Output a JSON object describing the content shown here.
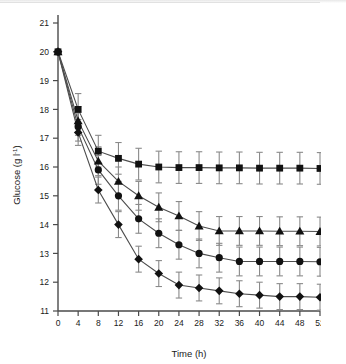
{
  "figure": {
    "background_color": "#ffffff",
    "axis_color": "#4a4a4a",
    "marker_color": "#111111",
    "line_color": "#4d4d4d",
    "errorbar_color": "#8a8a8a"
  },
  "chart_data": {
    "type": "line",
    "title": "",
    "subtitle": "",
    "xlabel": "Time (h)",
    "ylabel": "Glucose (g l⁻¹)",
    "ylabel_base": "Glucose (g l",
    "ylabel_exponent": "-1",
    "ylabel_close": ")",
    "xlim": [
      0,
      52
    ],
    "ylim": [
      11,
      21
    ],
    "xticks": [
      0,
      4,
      8,
      12,
      16,
      20,
      24,
      28,
      32,
      36,
      40,
      44,
      48,
      52
    ],
    "yticks": [
      11,
      12,
      13,
      14,
      15,
      16,
      17,
      18,
      19,
      20,
      21
    ],
    "xtick_labels": [
      "0",
      "4",
      "8",
      "12",
      "16",
      "20",
      "24",
      "28",
      "32",
      "36",
      "40",
      "44",
      "48",
      "52"
    ],
    "ytick_labels": [
      "11",
      "12",
      "13",
      "14",
      "15",
      "16",
      "17",
      "18",
      "19",
      "20",
      "21"
    ],
    "grid": false,
    "legend": false,
    "legend_position": "none",
    "x": [
      0,
      4,
      8,
      12,
      16,
      20,
      24,
      28,
      32,
      36,
      40,
      44,
      48,
      52
    ],
    "series": [
      {
        "name": "series-square",
        "marker": "square",
        "values": [
          20.0,
          18.0,
          16.55,
          16.3,
          16.1,
          16.0,
          15.98,
          15.98,
          15.97,
          15.97,
          15.96,
          15.96,
          15.96,
          15.95
        ],
        "errors": [
          0.0,
          0.55,
          0.55,
          0.55,
          0.55,
          0.55,
          0.55,
          0.55,
          0.55,
          0.55,
          0.55,
          0.55,
          0.55,
          0.55
        ]
      },
      {
        "name": "series-triangle",
        "marker": "triangle",
        "values": [
          20.0,
          17.6,
          16.2,
          15.5,
          15.0,
          14.6,
          14.3,
          13.95,
          13.78,
          13.78,
          13.78,
          13.77,
          13.77,
          13.76
        ],
        "errors": [
          0.0,
          0.5,
          0.5,
          0.5,
          0.5,
          0.5,
          0.5,
          0.5,
          0.5,
          0.5,
          0.5,
          0.5,
          0.5,
          0.5
        ]
      },
      {
        "name": "series-circle",
        "marker": "circle",
        "values": [
          20.0,
          17.4,
          15.9,
          15.0,
          14.2,
          13.7,
          13.3,
          13.0,
          12.85,
          12.72,
          12.72,
          12.72,
          12.72,
          12.71
        ],
        "errors": [
          0.0,
          0.5,
          0.5,
          0.5,
          0.5,
          0.5,
          0.5,
          0.5,
          0.5,
          0.5,
          0.5,
          0.5,
          0.5,
          0.5
        ]
      },
      {
        "name": "series-diamond",
        "marker": "diamond",
        "values": [
          20.0,
          17.2,
          15.2,
          14.0,
          12.8,
          12.3,
          11.9,
          11.8,
          11.7,
          11.6,
          11.55,
          11.5,
          11.5,
          11.48
        ],
        "errors": [
          0.0,
          0.45,
          0.45,
          0.45,
          0.45,
          0.45,
          0.45,
          0.45,
          0.45,
          0.45,
          0.45,
          0.45,
          0.45,
          0.45
        ]
      }
    ]
  }
}
